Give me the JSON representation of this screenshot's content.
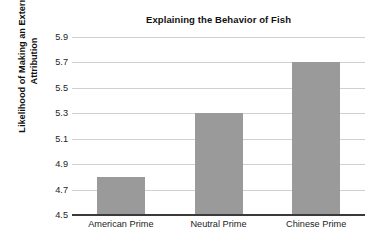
{
  "chart_data": {
    "type": "bar",
    "title": "Explaining the Behavior of Fish",
    "xlabel": "",
    "ylabel": "Likelihood of Making an External Attribution",
    "ylabel_lines": [
      "Likelihood of Making an External",
      "Attribution"
    ],
    "categories": [
      "American Prime",
      "Neutral Prime",
      "Chinese Prime"
    ],
    "values": [
      4.8,
      5.3,
      5.7
    ],
    "ylim": [
      4.5,
      5.9
    ],
    "ytick_labels": [
      "5.9",
      "5.7",
      "5.5",
      "5.3",
      "5.1",
      "4.9",
      "4.7",
      "4.5"
    ],
    "ytick_values": [
      5.9,
      5.7,
      5.5,
      5.3,
      5.1,
      4.9,
      4.7,
      4.5
    ],
    "ytick_step": 0.2,
    "grid": true,
    "grid_axis": "y",
    "legend": false,
    "legend_position": "none",
    "bar_color": "#9a9a9a",
    "gridline_color": "#d0d0d0",
    "axis_color": "#3a3a3a",
    "background_color": "#ffffff",
    "text_color": "#1d1d1d"
  }
}
